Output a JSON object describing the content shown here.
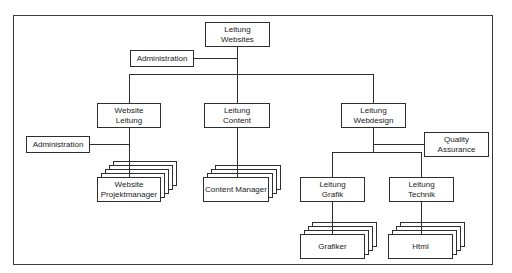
{
  "diagram": {
    "type": "org-chart",
    "root": {
      "label": "Leitung\nWebsites"
    },
    "root_staff": {
      "label": "Administration"
    },
    "departments": [
      {
        "label": "Website\nLeitung",
        "staff": "Administration",
        "team": "Website\nProjektmanager"
      },
      {
        "label": "Leitung\nContent",
        "team": "Content Manager"
      },
      {
        "label": "Leitung\nWebdesign",
        "staff": "Quality\nAssurance",
        "subunits": [
          {
            "label": "Leitung\nGrafik",
            "team": "Grafiker"
          },
          {
            "label": "Leitung\nTechnik",
            "team": "Html"
          }
        ]
      }
    ],
    "colors": {
      "line": "#2e2e2e",
      "box_fill": "#ffffff",
      "text": "#222222"
    }
  }
}
